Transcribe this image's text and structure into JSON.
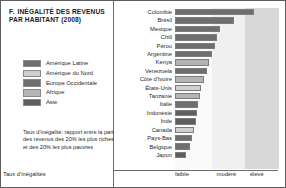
{
  "figure": {
    "number": "F.",
    "title": "INÉGALITÉ DES REVENUS PAR HABITANT (2008)",
    "note": "Taux d'inégalité: rapport entre la part des revenus des 20% les plus riches et des 20% les plus pauvres",
    "axis_caption": "Taux d'inégalités"
  },
  "legend": {
    "items": [
      {
        "label": "Amérique Latine",
        "color": "#6e6e6e"
      },
      {
        "label": "Amérique du Nord",
        "color": "#cfcfcf"
      },
      {
        "label": "Europe Occidentale",
        "color": "#6e6e6e"
      },
      {
        "label": "Afrique",
        "color": "#b4b4b4"
      },
      {
        "label": "Asie",
        "color": "#5e5e5e"
      }
    ]
  },
  "bands": [
    {
      "label": "faible",
      "color": "#fafafa",
      "start": 0,
      "end": 36
    },
    {
      "label": "modéré",
      "color": "#f0f0f0",
      "start": 36,
      "end": 67
    },
    {
      "label": "élevé",
      "color": "#d8d8d8",
      "start": 67,
      "end": 100
    }
  ],
  "chart_data": {
    "type": "bar",
    "orientation": "horizontal",
    "title": "INÉGALITÉ DES REVENUS PAR HABITANT (2008)",
    "xlabel": "Taux d'inégalités",
    "ylabel": "",
    "xlim": [
      0,
      100
    ],
    "grid": false,
    "tick_labels": [
      "faible",
      "modéré",
      "élevé"
    ],
    "legend_position": "left",
    "categories": [
      "Colombie",
      "Brésil",
      "Mexique",
      "Chili",
      "Pérou",
      "Argentine",
      "Kenya",
      "Venezuela",
      "Côte d'Ivoire",
      "États-Unis",
      "Tanzanie",
      "Italie",
      "Indonésie",
      "Inde",
      "Canada",
      "Pays-Bas",
      "Belgique",
      "Japon"
    ],
    "values": [
      76,
      57,
      43,
      40,
      38,
      36,
      33,
      31,
      28,
      25,
      24,
      22,
      21,
      20,
      18,
      16,
      14,
      11
    ],
    "groups": [
      "Amérique Latine",
      "Amérique Latine",
      "Amérique Latine",
      "Amérique Latine",
      "Amérique Latine",
      "Amérique Latine",
      "Afrique",
      "Amérique Latine",
      "Afrique",
      "Amérique du Nord",
      "Afrique",
      "Europe Occidentale",
      "Asie",
      "Asie",
      "Amérique du Nord",
      "Europe Occidentale",
      "Europe Occidentale",
      "Asie"
    ],
    "bar_colors": [
      "#6e6e6e",
      "#6e6e6e",
      "#6e6e6e",
      "#6e6e6e",
      "#6e6e6e",
      "#6e6e6e",
      "#b4b4b4",
      "#6e6e6e",
      "#b4b4b4",
      "#cfcfcf",
      "#b4b4b4",
      "#6e6e6e",
      "#5e5e5e",
      "#5e5e5e",
      "#cfcfcf",
      "#6e6e6e",
      "#6e6e6e",
      "#5e5e5e"
    ]
  }
}
